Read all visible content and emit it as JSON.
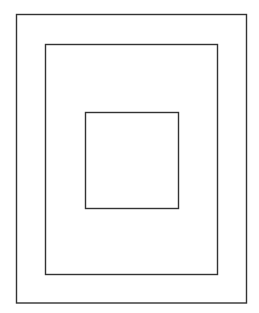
{
  "diagram": {
    "canvas": {
      "width": 259,
      "height": 313,
      "background": "#ffffff"
    },
    "stroke_color": "#333333",
    "stroke_width": 1.4,
    "shapes": [
      {
        "id": "outer-rectangle",
        "x": 16.5,
        "y": 14.5,
        "width": 230,
        "height": 288.5
      },
      {
        "id": "middle-rectangle",
        "x": 45.5,
        "y": 44.5,
        "width": 172,
        "height": 230
      },
      {
        "id": "inner-square",
        "x": 85.5,
        "y": 112.5,
        "width": 93,
        "height": 96
      }
    ]
  }
}
